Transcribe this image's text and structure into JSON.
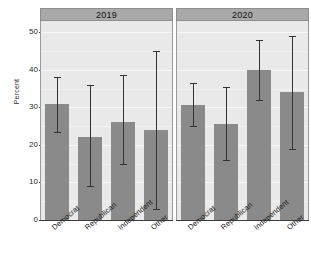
{
  "chart_data": {
    "type": "bar",
    "title": "",
    "subtitle": "",
    "xlabel": "",
    "ylabel": "Percent",
    "ylim": [
      0,
      53
    ],
    "yticks": [
      0,
      10,
      20,
      30,
      40,
      50
    ],
    "ytick_labels": [
      "0",
      "10",
      "20",
      "30",
      "40",
      "50"
    ],
    "grid": true,
    "legend": "none",
    "error_bars": "95% CI",
    "categories": [
      "Democrat",
      "Republican",
      "Independent",
      "Other"
    ],
    "panels": [
      {
        "label": "2019",
        "values": [
          31,
          22,
          26,
          24
        ],
        "ci_low": [
          23.5,
          9,
          15,
          3
        ],
        "ci_high": [
          38,
          36,
          38.5,
          45
        ]
      },
      {
        "label": "2020",
        "values": [
          30.5,
          25.5,
          40,
          34
        ],
        "ci_low": [
          25,
          16,
          32,
          19
        ],
        "ci_high": [
          36.5,
          35.5,
          48,
          49
        ]
      }
    ],
    "colors": {
      "bar": "#8a8a8a",
      "panel_background": "#e9e9e9",
      "strip_background": "#a9a9a9",
      "error_bar": "#333333",
      "grid": "#f7f7f7"
    }
  }
}
